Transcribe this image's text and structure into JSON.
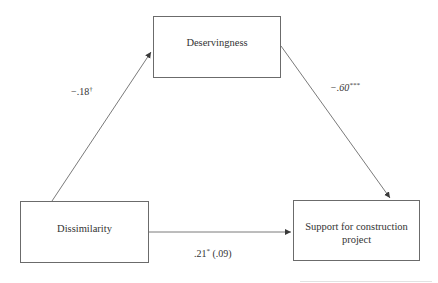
{
  "diagram": {
    "type": "mediation-path-diagram",
    "nodes": {
      "mediator": {
        "label": "Deservingness"
      },
      "predictor": {
        "label": "Dissimilarity"
      },
      "outcome": {
        "label": "Support for construction project"
      }
    },
    "paths": {
      "a": {
        "from": "Dissimilarity",
        "to": "Deservingness",
        "coef": "−.18",
        "sig": "†"
      },
      "b": {
        "from": "Deservingness",
        "to": "Support for construction project",
        "coef": "−.60",
        "sig": "***"
      },
      "c": {
        "from": "Dissimilarity",
        "to": "Support for construction project",
        "coef": ".21",
        "sig": "*",
        "direct": " (.09)"
      }
    },
    "colors": {
      "line": "#6b6b6b",
      "text": "#333333",
      "background": "#ffffff"
    }
  }
}
